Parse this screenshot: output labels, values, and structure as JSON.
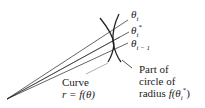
{
  "labels": {
    "theta_i": {
      "sym": "θ",
      "sub": "i"
    },
    "theta_star": {
      "sym": "θ",
      "sub": "i",
      "sup": "*"
    },
    "theta_prev": {
      "sym": "θ",
      "sub": "i − 1"
    },
    "curve_line1": "Curve",
    "curve_line2": "r = f(θ)",
    "circle_line1": "Part of",
    "circle_line2": "circle of",
    "circle_line3_text": "radius ",
    "circle_line3_math": "f(θ",
    "circle_line3_sub": "i",
    "circle_line3_sup": "*",
    "circle_line3_close": ")"
  },
  "colors": {
    "stroke": "#222222",
    "leader": "#999999"
  }
}
